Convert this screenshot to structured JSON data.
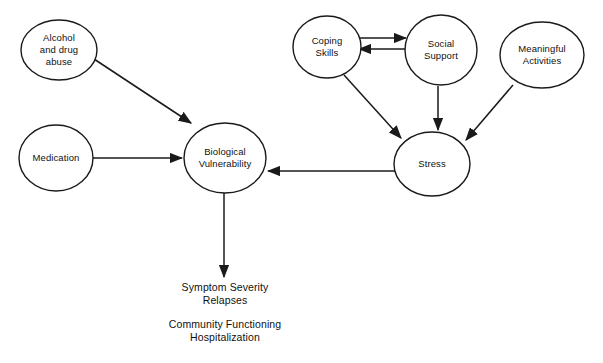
{
  "diagram": {
    "background_color": "#ffffff",
    "stroke_color": "#1a1a1a",
    "text_color": "#111111",
    "nodes": [
      {
        "id": "alcohol-and-drug-abuse",
        "label_lines": [
          "Alcohol",
          "and drug",
          "abuse"
        ],
        "shape": "ellipse",
        "cx": 59,
        "cy": 50,
        "rx": 38,
        "ry": 30
      },
      {
        "id": "medication",
        "label_lines": [
          "Medication"
        ],
        "shape": "ellipse",
        "cx": 56,
        "cy": 158,
        "rx": 37,
        "ry": 33
      },
      {
        "id": "biological-vulnerability",
        "label_lines": [
          "Biological",
          "Vulnerability"
        ],
        "shape": "ellipse",
        "cx": 225,
        "cy": 158,
        "rx": 41,
        "ry": 35
      },
      {
        "id": "coping-skills",
        "label_lines": [
          "Coping",
          "Skills"
        ],
        "shape": "ellipse",
        "cx": 327,
        "cy": 47,
        "rx": 34,
        "ry": 31
      },
      {
        "id": "social-support",
        "label_lines": [
          "Social",
          "Support"
        ],
        "shape": "ellipse",
        "cx": 441,
        "cy": 50,
        "rx": 36,
        "ry": 35
      },
      {
        "id": "meaningful-activities",
        "label_lines": [
          "Meaningful",
          "Activities"
        ],
        "shape": "ellipse",
        "cx": 542,
        "cy": 55,
        "rx": 42,
        "ry": 33
      },
      {
        "id": "stress",
        "label_lines": [
          "Stress"
        ],
        "shape": "ellipse",
        "cx": 432,
        "cy": 164,
        "rx": 38,
        "ry": 32
      }
    ],
    "edges": [
      {
        "id": "alcohol-to-biological-vulnerability",
        "from": "alcohol-and-drug-abuse",
        "to": "biological-vulnerability",
        "kind": "arrow",
        "x1": 94,
        "y1": 59,
        "x2": 191,
        "y2": 123
      },
      {
        "id": "medication-to-biological-vulnerability",
        "from": "medication",
        "to": "biological-vulnerability",
        "kind": "arrow",
        "x1": 93,
        "y1": 158,
        "x2": 182,
        "y2": 158
      },
      {
        "id": "coping-skills-to-social-support",
        "from": "coping-skills",
        "to": "social-support",
        "kind": "arrow",
        "x1": 359,
        "y1": 38,
        "x2": 406,
        "y2": 38
      },
      {
        "id": "social-support-to-coping-skills",
        "from": "social-support",
        "to": "coping-skills",
        "kind": "arrow",
        "x1": 406,
        "y1": 49,
        "x2": 359,
        "y2": 49
      },
      {
        "id": "coping-skills-to-stress",
        "from": "coping-skills",
        "to": "stress",
        "kind": "arrow",
        "x1": 344,
        "y1": 75,
        "x2": 401,
        "y2": 138
      },
      {
        "id": "social-support-to-stress",
        "from": "social-support",
        "to": "stress",
        "kind": "arrow",
        "x1": 438,
        "y1": 86,
        "x2": 438,
        "y2": 130
      },
      {
        "id": "meaningful-activities-to-stress",
        "from": "meaningful-activities",
        "to": "stress",
        "kind": "arrow",
        "x1": 513,
        "y1": 85,
        "x2": 466,
        "y2": 140
      },
      {
        "id": "stress-to-biological-vulnerability",
        "from": "stress",
        "to": "biological-vulnerability",
        "kind": "arrow",
        "x1": 396,
        "y1": 171,
        "x2": 268,
        "y2": 171
      },
      {
        "id": "biological-vulnerability-to-outcomes",
        "from": "biological-vulnerability",
        "to": "outcomes",
        "kind": "arrow",
        "x1": 224,
        "y1": 193,
        "x2": 224,
        "y2": 277
      }
    ],
    "outcomes": {
      "id": "outcomes",
      "primary_lines": [
        "Symptom Severity",
        "Relapses"
      ],
      "secondary_lines": [
        "Community Functioning",
        "Hospitalization"
      ],
      "center_x": 225,
      "primary_y": [
        291,
        304
      ],
      "secondary_y": [
        328,
        341
      ]
    }
  }
}
